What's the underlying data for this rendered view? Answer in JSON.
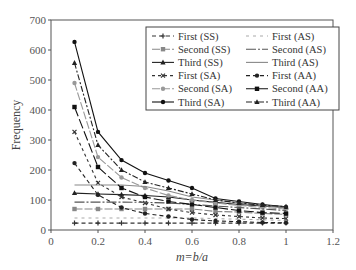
{
  "chart_data": {
    "type": "line",
    "title": "",
    "xlabel": "m = b/a",
    "ylabel": "Frequency",
    "xlim": [
      0,
      1.2
    ],
    "ylim": [
      0,
      700
    ],
    "xticks": [
      0,
      0.2,
      0.4,
      0.6,
      0.8,
      1,
      1.2
    ],
    "xtick_labels": [
      "0",
      "0.2",
      "0.4",
      "0.6",
      "0.8",
      "1",
      "1.2"
    ],
    "yticks": [
      0,
      100,
      200,
      300,
      400,
      500,
      600,
      700
    ],
    "ytick_labels": [
      "0",
      "100",
      "200",
      "300",
      "400",
      "500",
      "600",
      "700"
    ],
    "grid": false,
    "legend_position": "upper right, two columns, boxed",
    "x": [
      0.1,
      0.2,
      0.3,
      0.4,
      0.5,
      0.6,
      0.7,
      0.8,
      0.9,
      1.0
    ],
    "series": [
      {
        "name": "First (SS)",
        "dash": "4,3",
        "marker": "plus",
        "color": "#333",
        "values": [
          23,
          23,
          23,
          23,
          23,
          23,
          23,
          23,
          23,
          23
        ]
      },
      {
        "name": "Second (SS)",
        "dash": "8,2",
        "marker": "square",
        "color": "#888",
        "values": [
          70,
          70,
          70,
          70,
          70,
          70,
          62,
          60,
          55,
          52
        ]
      },
      {
        "name": "Third (SS)",
        "dash": "",
        "marker": "triangle",
        "color": "#222",
        "values": [
          123,
          120,
          118,
          115,
          110,
          100,
          92,
          85,
          80,
          75
        ]
      },
      {
        "name": "First (SA)",
        "dash": "3,3",
        "marker": "x",
        "color": "#333",
        "values": [
          327,
          157,
          110,
          90,
          70,
          58,
          50,
          45,
          40,
          38
        ]
      },
      {
        "name": "Second (SA)",
        "dash": "8,2",
        "marker": "dot",
        "color": "#999",
        "values": [
          490,
          243,
          175,
          140,
          115,
          100,
          90,
          82,
          75,
          70
        ]
      },
      {
        "name": "Third (SA)",
        "dash": "",
        "marker": "dot",
        "color": "#111",
        "values": [
          627,
          327,
          233,
          190,
          165,
          140,
          105,
          95,
          85,
          77
        ]
      },
      {
        "name": "First (AS)",
        "dash": "3,4",
        "marker": "none",
        "color": "#aaa",
        "values": [
          40,
          40,
          40,
          40,
          40,
          40,
          38,
          36,
          34,
          32
        ]
      },
      {
        "name": "Second (AS)",
        "dash": "10,2,2,2",
        "marker": "none",
        "color": "#555",
        "values": [
          93,
          93,
          93,
          92,
          90,
          85,
          80,
          75,
          70,
          65
        ]
      },
      {
        "name": "Third (AS)",
        "dash": "",
        "marker": "none",
        "color": "#888",
        "values": [
          150,
          150,
          150,
          145,
          130,
          110,
          100,
          90,
          82,
          75
        ]
      },
      {
        "name": "First (AA)",
        "dash": "4,3",
        "marker": "dot",
        "color": "#222",
        "values": [
          223,
          117,
          75,
          55,
          45,
          35,
          30,
          28,
          25,
          24
        ]
      },
      {
        "name": "Second (AA)",
        "dash": "10,3",
        "marker": "square",
        "color": "#111",
        "values": [
          410,
          210,
          140,
          110,
          95,
          85,
          75,
          65,
          58,
          55
        ]
      },
      {
        "name": "Third (AA)",
        "dash": "6,2,2,2",
        "marker": "triangle",
        "color": "#222",
        "values": [
          557,
          283,
          200,
          160,
          140,
          120,
          100,
          90,
          83,
          78
        ]
      }
    ]
  },
  "layout": {
    "plot": {
      "left": 51,
      "right": 333,
      "top": 20,
      "bottom": 230
    }
  }
}
